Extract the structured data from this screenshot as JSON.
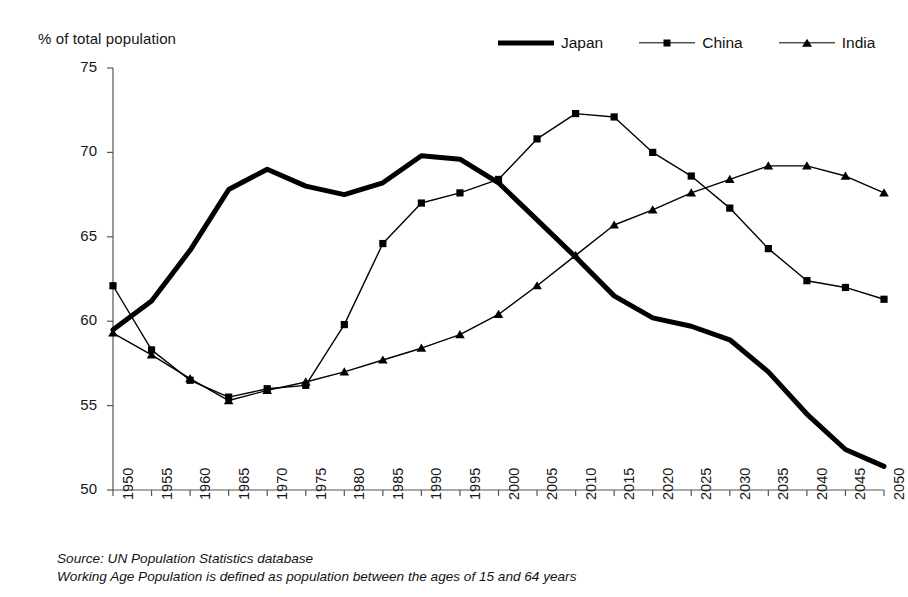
{
  "axis_title": "% of total population",
  "legend": {
    "position": "top-right",
    "entries": [
      {
        "label": "Japan",
        "style": "thick-line",
        "marker": "none"
      },
      {
        "label": "China",
        "style": "thin-line",
        "marker": "square"
      },
      {
        "label": "India",
        "style": "thin-line",
        "marker": "triangle"
      }
    ]
  },
  "notes": {
    "source": "Source: UN Population Statistics database",
    "definition": "Working Age Population is defined as population between the ages of 15 and 64 years"
  },
  "chart_data": {
    "type": "line",
    "title": "",
    "subtitle": "",
    "xlabel": "",
    "ylabel": "% of total population",
    "ylim": [
      50,
      75
    ],
    "ytick_step": 5,
    "yticks": [
      50,
      55,
      60,
      65,
      70,
      75
    ],
    "grid": false,
    "legend_position": "top-right",
    "x": [
      1950,
      1955,
      1960,
      1965,
      1970,
      1975,
      1980,
      1985,
      1990,
      1995,
      2000,
      2005,
      2010,
      2015,
      2020,
      2025,
      2030,
      2035,
      2040,
      2045,
      2050
    ],
    "categories": [
      "1950",
      "1955",
      "1960",
      "1965",
      "1970",
      "1975",
      "1980",
      "1985",
      "1990",
      "1995",
      "2000",
      "2005",
      "2010",
      "2015",
      "2020",
      "2025",
      "2030",
      "2035",
      "2040",
      "2045",
      "2050"
    ],
    "series": [
      {
        "name": "Japan",
        "marker": "none",
        "linewidth": 5,
        "color": "#000000",
        "values": [
          59.5,
          61.2,
          64.2,
          67.8,
          69.0,
          68.0,
          67.5,
          68.2,
          69.8,
          69.6,
          68.2,
          66.0,
          63.8,
          61.5,
          60.2,
          59.7,
          58.9,
          57.0,
          54.5,
          52.4,
          51.4
        ]
      },
      {
        "name": "China",
        "marker": "square",
        "linewidth": 1.4,
        "color": "#000000",
        "values": [
          62.1,
          58.3,
          56.5,
          55.5,
          56.0,
          56.2,
          59.8,
          64.6,
          67.0,
          67.6,
          68.4,
          70.8,
          72.3,
          72.1,
          70.0,
          68.6,
          66.7,
          64.3,
          62.4,
          62.0,
          61.3
        ]
      },
      {
        "name": "India",
        "marker": "triangle",
        "linewidth": 1.4,
        "color": "#000000",
        "values": [
          59.3,
          58.0,
          56.6,
          55.3,
          55.9,
          56.4,
          57.0,
          57.7,
          58.4,
          59.2,
          60.4,
          62.1,
          63.9,
          65.7,
          66.6,
          67.6,
          68.4,
          69.2,
          69.2,
          68.6,
          67.6
        ]
      }
    ]
  }
}
